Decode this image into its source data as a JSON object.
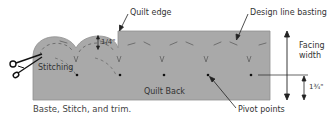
{
  "diagram": {
    "caption": "Baste, Stitch, and trim.",
    "labels": {
      "quilt_edge": "Quilt edge",
      "design_line_basting": "Design line basting",
      "facing_width_line1": "Facing",
      "facing_width_line2": "width",
      "stitching": "Stitching",
      "quilt_back": "Quilt Back",
      "pivot_points": "Pivot points",
      "quarter_inch": "1/4\"",
      "one_three_quarter_inch": "1¾\""
    },
    "colors": {
      "fabric": "#a9a9a9",
      "fabric_edge": "#8f8f8f",
      "stitch": "#6f6f6f",
      "basting": "#7a7a7a",
      "arrow": "#222222",
      "text": "#333333"
    }
  }
}
